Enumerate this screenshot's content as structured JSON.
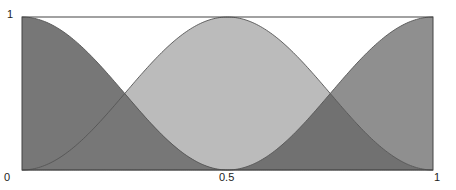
{
  "chart_data": {
    "type": "area",
    "title": "",
    "xlabel": "",
    "ylabel": "",
    "xlim": [
      0,
      1
    ],
    "ylim": [
      0,
      1
    ],
    "grid": false,
    "x_ticks": [
      "0",
      "0.5",
      "1"
    ],
    "y_ticks": [
      "0",
      "1"
    ],
    "series": [
      {
        "name": "left basis",
        "formula": "cos^2(pi x) for x<=0.5, else 0",
        "x": [
          0,
          0.125,
          0.25,
          0.375,
          0.5,
          1
        ],
        "values": [
          1,
          0.854,
          0.5,
          0.146,
          0,
          0
        ],
        "color": "#777777"
      },
      {
        "name": "middle basis",
        "formula": "sin^2(pi x)",
        "x": [
          0,
          0.125,
          0.25,
          0.375,
          0.5,
          0.625,
          0.75,
          0.875,
          1
        ],
        "values": [
          0,
          0.146,
          0.5,
          0.854,
          1,
          0.854,
          0.5,
          0.146,
          0
        ],
        "color": "#bbbbbb"
      },
      {
        "name": "right basis",
        "formula": "cos^2(pi x) for x>=0.5, else 0",
        "x": [
          0,
          0.5,
          0.625,
          0.75,
          0.875,
          1
        ],
        "values": [
          0,
          0,
          0.146,
          0.5,
          0.854,
          1
        ],
        "color": "#8f8f8f"
      }
    ],
    "overlap_color": "#717171",
    "labels": {
      "x0": "0",
      "xmid": "0.5",
      "x1": "1",
      "y0": "0",
      "y1": "1"
    }
  }
}
